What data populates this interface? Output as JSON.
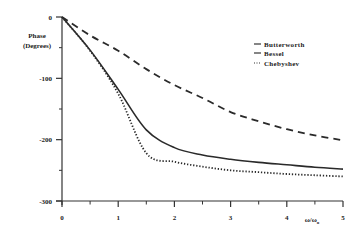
{
  "chart_data": {
    "type": "line",
    "title": "",
    "xlabel": "ω/ωo",
    "ylabel": "Phase (Degrees)",
    "ylabel_lines": [
      "Phase",
      "(Degrees)"
    ],
    "xlim": [
      0,
      5
    ],
    "ylim": [
      -300,
      0
    ],
    "x_ticks": [
      0,
      1,
      2,
      3,
      4,
      5
    ],
    "x_minor_ticks": [
      0.5,
      1.5,
      2.5,
      3.5,
      4.5
    ],
    "x_tick_labels": [
      "0",
      "1",
      "2",
      "3",
      "4",
      "5"
    ],
    "y_ticks": [
      0,
      -100,
      -200,
      -300
    ],
    "y_minor_ticks": [
      -50,
      -150,
      -250
    ],
    "y_tick_labels": [
      "0",
      "-100",
      "-200",
      "-300"
    ],
    "grid": false,
    "legend_position": "top-right",
    "x": [
      0,
      0.5,
      1,
      1.5,
      2,
      2.5,
      3,
      3.5,
      4,
      4.5,
      5
    ],
    "series": [
      {
        "name": "Butterworth",
        "style": "dashed",
        "values": [
          0,
          -30,
          -55,
          -85,
          -111,
          -132,
          -155,
          -170,
          -183,
          -193,
          -201
        ]
      },
      {
        "name": "Bessel",
        "style": "solid",
        "values": [
          0,
          -54,
          -118,
          -184,
          -213,
          -225,
          -232,
          -237,
          -241,
          -245,
          -248
        ]
      },
      {
        "name": "Chebyshev",
        "style": "dotted",
        "values": [
          0,
          -55,
          -125,
          -222,
          -236,
          -244,
          -250,
          -253,
          -256,
          -258,
          -260
        ]
      }
    ],
    "legend": [
      {
        "marker": "—",
        "label": "Butterworth"
      },
      {
        "marker": "—",
        "label": "Bessel"
      },
      {
        "marker": "...",
        "label": "Chebyshev"
      }
    ]
  }
}
